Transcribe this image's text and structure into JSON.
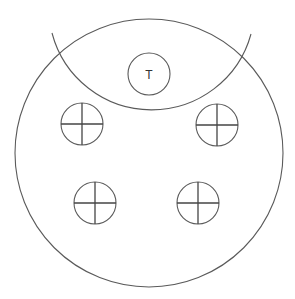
{
  "diagram": {
    "width": 295,
    "height": 299,
    "background": "#ffffff",
    "stroke_color": "#5a5a5a",
    "cross_color": "#444444",
    "outer_circle": {
      "cx": 149,
      "cy": 153,
      "r": 134
    },
    "upper_arc": {
      "cx": 151,
      "cy": 7,
      "r": 103,
      "start": [
        52,
        33
      ],
      "end": [
        251,
        34
      ]
    },
    "center_marker": {
      "cx": 149,
      "cy": 74,
      "r": 21,
      "label": "T"
    },
    "crosshair_markers": [
      {
        "id": "top-left",
        "cx": 82,
        "cy": 124,
        "r": 21
      },
      {
        "id": "top-right",
        "cx": 217,
        "cy": 125,
        "r": 21
      },
      {
        "id": "bottom-left",
        "cx": 95,
        "cy": 203,
        "r": 21
      },
      {
        "id": "bottom-right",
        "cx": 198,
        "cy": 203,
        "r": 21
      }
    ]
  }
}
